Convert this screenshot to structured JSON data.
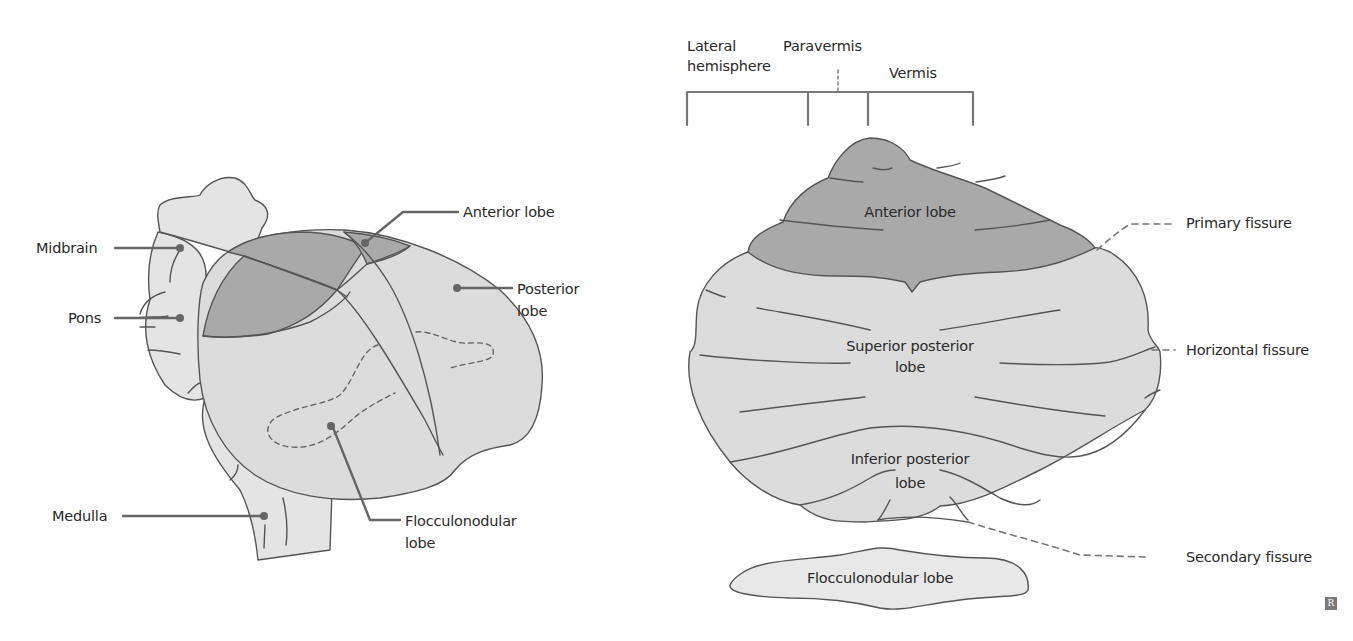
{
  "colors": {
    "light_fill": "#dcdcdc",
    "dark_fill": "#a9a9a9",
    "brainstem_fill": "#e6e6e6",
    "outline": "#555555",
    "leader": "#666666",
    "text": "#2a2a2a"
  },
  "left_view": {
    "labels": {
      "midbrain": "Midbrain",
      "pons": "Pons",
      "medulla": "Medulla",
      "anterior_lobe": "Anterior lobe",
      "posterior_lobe_1": "Posterior",
      "posterior_lobe_2": "lobe",
      "flocculonodular_1": "Flocculonodular",
      "flocculonodular_2": "lobe"
    }
  },
  "right_view": {
    "zones": {
      "lateral_1": "Lateral",
      "lateral_2": "hemisphere",
      "paravermis": "Paravermis",
      "vermis": "Vermis"
    },
    "regions": {
      "anterior": "Anterior lobe",
      "superior_posterior_1": "Superior posterior",
      "superior_posterior_2": "lobe",
      "inferior_posterior_1": "Inferior posterior",
      "inferior_posterior_2": "lobe",
      "flocculonodular": "Flocculonodular lobe"
    },
    "fissures": {
      "primary": "Primary fissure",
      "horizontal": "Horizontal fissure",
      "secondary": "Secondary fissure"
    }
  },
  "watermark": "R"
}
